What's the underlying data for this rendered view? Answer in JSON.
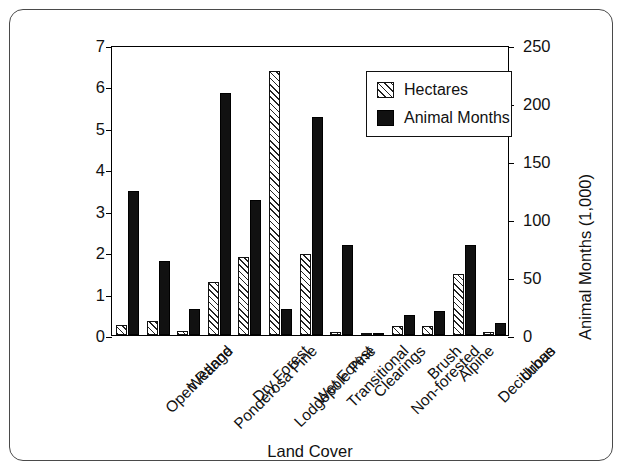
{
  "figure": {
    "border_color": "#4a4a4a",
    "background": "#ffffff"
  },
  "legend": {
    "position": "top-right-inside",
    "entries": [
      {
        "label": "Hectares",
        "swatch": "hatched-diagonal",
        "color": "#ffffff"
      },
      {
        "label": "Animal Months",
        "swatch": "solid",
        "color": "#111111"
      }
    ]
  },
  "axes": {
    "left": {
      "title": "Millions of Hectares",
      "ticks": [
        "7",
        "6",
        "5",
        "4",
        "3",
        "2",
        "1",
        "0"
      ],
      "min": 0,
      "max": 7
    },
    "right": {
      "title": "Animal Months (1,000)",
      "ticks": [
        "250",
        "200",
        "150",
        "100",
        "50",
        "0"
      ],
      "min": 0,
      "max": 250
    },
    "bottom": {
      "title": "Land Cover"
    }
  },
  "chart_data": {
    "type": "bar",
    "title": "",
    "subtitle": "",
    "xlabel": "Land Cover",
    "ylabel": "Millions of Hectares",
    "y2label": "Animal Months (1,000)",
    "ylim": [
      0,
      7
    ],
    "y2lim": [
      0,
      250
    ],
    "yticks": [
      0,
      1,
      2,
      3,
      4,
      5,
      6,
      7
    ],
    "y2ticks": [
      0,
      50,
      100,
      150,
      200,
      250
    ],
    "grid": false,
    "legend_position": "upper right",
    "categories": [
      "Open Range",
      "Wetland",
      "Ponderosa Pine",
      "Dry Forest",
      "Lodgepole Pine",
      "Wet Forest",
      "Transitional",
      "Clearings",
      "Non-forested",
      "Brush",
      "Alpine",
      "Deciduous",
      "Urban"
    ],
    "series": [
      {
        "name": "Hectares",
        "axis": "left",
        "units": "Millions of Hectares",
        "values": [
          0.25,
          0.33,
          0.1,
          1.28,
          1.88,
          6.38,
          1.95,
          0.07,
          0.02,
          0.22,
          0.22,
          1.48,
          0.08
        ]
      },
      {
        "name": "Animal Months",
        "axis": "right",
        "units": "Animal Months (1,000)",
        "values_left_scale": [
          3.47,
          1.78,
          0.62,
          5.85,
          3.25,
          0.62,
          5.27,
          2.18,
          0.03,
          0.48,
          0.57,
          2.18,
          0.28
        ],
        "values": [
          124,
          64,
          22,
          209,
          116,
          22,
          188,
          78,
          1,
          17,
          20,
          78,
          10
        ]
      }
    ]
  }
}
